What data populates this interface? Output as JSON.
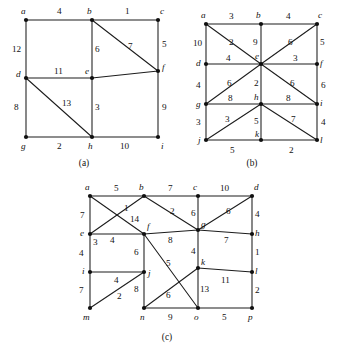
{
  "figure": {
    "background_color": "#ffffff",
    "ink_color": "#1c1c1c",
    "panels": [
      {
        "id": "a",
        "caption": "(a)",
        "caption_pos": [
          84,
          163
        ],
        "vertices": [
          {
            "name": "a",
            "x": 26,
            "y": 20,
            "label": "a",
            "label_pos": [
              21,
              14
            ]
          },
          {
            "name": "b",
            "x": 92,
            "y": 20,
            "label": "b",
            "label_pos": [
              87,
              14
            ]
          },
          {
            "name": "c",
            "x": 158,
            "y": 20,
            "label": "c",
            "label_pos": [
              160,
              14
            ]
          },
          {
            "name": "d",
            "x": 26,
            "y": 78,
            "label": "d",
            "label_pos": [
              18,
              76
            ]
          },
          {
            "name": "e",
            "x": 92,
            "y": 78,
            "label": "e",
            "label_pos": [
              85,
              74
            ]
          },
          {
            "name": "f",
            "x": 158,
            "y": 71,
            "label": "f",
            "label_pos": [
              162,
              70
            ]
          },
          {
            "name": "g",
            "x": 26,
            "y": 137,
            "label": "g",
            "label_pos": [
              21,
              148
            ]
          },
          {
            "name": "h",
            "x": 92,
            "y": 137,
            "label": "h",
            "label_pos": [
              88,
              148
            ]
          },
          {
            "name": "i",
            "x": 158,
            "y": 137,
            "label": "i",
            "label_pos": [
              161,
              148
            ]
          }
        ],
        "edges": [
          {
            "from": "a",
            "to": "b",
            "weight": "4",
            "label_pos": [
              57,
              13
            ]
          },
          {
            "from": "b",
            "to": "c",
            "weight": "1",
            "label_pos": [
              125,
              13
            ]
          },
          {
            "from": "a",
            "to": "d",
            "weight": "12",
            "label_pos": [
              15,
              52
            ]
          },
          {
            "from": "b",
            "to": "e",
            "weight": "6",
            "label_pos": [
              96,
              52
            ]
          },
          {
            "from": "c",
            "to": "f",
            "weight": "5",
            "label_pos": [
              163,
              47
            ]
          },
          {
            "from": "b",
            "to": "f",
            "weight": "7",
            "label_pos": [
              130,
              48
            ]
          },
          {
            "from": "d",
            "to": "e",
            "weight": "11",
            "label_pos": [
              55,
              73
            ]
          },
          {
            "from": "e",
            "to": "f",
            "weight": "",
            "label_pos": [
              128,
              73
            ]
          },
          {
            "from": "d",
            "to": "g",
            "weight": "8",
            "label_pos": [
              16,
              110
            ]
          },
          {
            "from": "e",
            "to": "h",
            "weight": "3",
            "label_pos": [
              96,
              110
            ]
          },
          {
            "from": "f",
            "to": "i",
            "weight": "9",
            "label_pos": [
              163,
              110
            ]
          },
          {
            "from": "d",
            "to": "h",
            "weight": "13",
            "label_pos": [
              66,
              104
            ]
          },
          {
            "from": "g",
            "to": "h",
            "weight": "2",
            "label_pos": [
              57,
              148
            ]
          },
          {
            "from": "h",
            "to": "i",
            "weight": "10",
            "label_pos": [
              122,
              148
            ]
          }
        ]
      },
      {
        "id": "b",
        "caption": "(b)",
        "caption_pos": [
          252,
          163
        ],
        "vertices": [
          {
            "name": "a",
            "x": 206,
            "y": 24,
            "label": "a",
            "label_pos": [
              201,
              17
            ]
          },
          {
            "name": "b",
            "x": 261,
            "y": 24,
            "label": "b",
            "label_pos": [
              256,
              17
            ]
          },
          {
            "name": "c",
            "x": 317,
            "y": 24,
            "label": "c",
            "label_pos": [
              318,
              17
            ]
          },
          {
            "name": "d",
            "x": 206,
            "y": 64,
            "label": "d",
            "label_pos": [
              198,
              63
            ]
          },
          {
            "name": "e",
            "x": 261,
            "y": 64,
            "label": "e",
            "label_pos": [
              256,
              58
            ]
          },
          {
            "name": "f",
            "x": 317,
            "y": 64,
            "label": "f",
            "label_pos": [
              320,
              63
            ]
          },
          {
            "name": "g",
            "x": 206,
            "y": 104,
            "label": "g",
            "label_pos": [
              198,
              105
            ]
          },
          {
            "name": "h",
            "x": 261,
            "y": 104,
            "label": "h",
            "label_pos": [
              255,
              98
            ]
          },
          {
            "name": "i",
            "x": 317,
            "y": 104,
            "label": "i",
            "label_pos": [
              320,
              104
            ]
          },
          {
            "name": "j",
            "x": 206,
            "y": 140,
            "label": "j",
            "label_pos": [
              199,
              140
            ]
          },
          {
            "name": "k",
            "x": 261,
            "y": 140,
            "label": "k",
            "label_pos": [
              256,
              134
            ]
          },
          {
            "name": "l",
            "x": 317,
            "y": 140,
            "label": "l",
            "label_pos": [
              320,
              140
            ]
          }
        ],
        "edges": [
          {
            "from": "a",
            "to": "b",
            "weight": "3",
            "label_pos": [
              230,
              18
            ]
          },
          {
            "from": "b",
            "to": "c",
            "weight": "4",
            "label_pos": [
              287,
              18
            ]
          },
          {
            "from": "a",
            "to": "d",
            "weight": "10",
            "label_pos": [
              195,
              45
            ]
          },
          {
            "from": "b",
            "to": "e",
            "weight": "9",
            "label_pos": [
              254,
              44
            ]
          },
          {
            "from": "c",
            "to": "f",
            "weight": "5",
            "label_pos": [
              321,
              44
            ]
          },
          {
            "from": "a",
            "to": "e",
            "weight": "2",
            "label_pos": [
              232,
              44
            ]
          },
          {
            "from": "c",
            "to": "e",
            "weight": "6",
            "label_pos": [
              289,
              44
            ]
          },
          {
            "from": "d",
            "to": "e",
            "weight": "4",
            "label_pos": [
              228,
              60
            ]
          },
          {
            "from": "e",
            "to": "f",
            "weight": "3",
            "label_pos": [
              293,
              60
            ]
          },
          {
            "from": "d",
            "to": "g",
            "weight": "4",
            "label_pos": [
              197,
              87
            ]
          },
          {
            "from": "e",
            "to": "h",
            "weight": "2",
            "label_pos": [
              255,
              84
            ]
          },
          {
            "from": "f",
            "to": "i",
            "weight": "6",
            "label_pos": [
              322,
              86
            ]
          },
          {
            "from": "g",
            "to": "e",
            "weight": "6",
            "label_pos": [
              229,
              84
            ]
          },
          {
            "from": "e",
            "to": "i",
            "weight": "6",
            "label_pos": [
              291,
              84
            ]
          },
          {
            "from": "g",
            "to": "h",
            "weight": "8",
            "label_pos": [
              229,
              99
            ]
          },
          {
            "from": "h",
            "to": "i",
            "weight": "8",
            "label_pos": [
              287,
              99
            ]
          },
          {
            "from": "g",
            "to": "j",
            "weight": "3",
            "label_pos": [
              197,
              124
            ]
          },
          {
            "from": "h",
            "to": "k",
            "weight": "5",
            "label_pos": [
              255,
              122
            ]
          },
          {
            "from": "i",
            "to": "l",
            "weight": "4",
            "label_pos": [
              322,
              124
            ]
          },
          {
            "from": "j",
            "to": "h",
            "weight": "3",
            "label_pos": [
              227,
              121
            ]
          },
          {
            "from": "h",
            "to": "l",
            "weight": "7",
            "label_pos": [
              292,
              121
            ]
          },
          {
            "from": "j",
            "to": "k",
            "weight": "5",
            "label_pos": [
              231,
              152
            ]
          },
          {
            "from": "k",
            "to": "l",
            "weight": "2",
            "label_pos": [
              290,
              152
            ]
          }
        ]
      },
      {
        "id": "c",
        "caption": "(c)",
        "caption_pos": [
          167,
          338
        ]
      }
    ],
    "panel_c": {
      "vertices": [
        {
          "name": "a",
          "x": 90,
          "y": 196,
          "label": "a",
          "label_pos": [
            85,
            190
          ]
        },
        {
          "name": "b",
          "x": 144,
          "y": 196,
          "label": "b",
          "label_pos": [
            139,
            190
          ]
        },
        {
          "name": "c",
          "x": 198,
          "y": 196,
          "label": "c",
          "label_pos": [
            193,
            190
          ]
        },
        {
          "name": "d",
          "x": 252,
          "y": 196,
          "label": "d",
          "label_pos": [
            254,
            190
          ]
        },
        {
          "name": "e",
          "x": 90,
          "y": 234,
          "label": "e",
          "label_pos": [
            82,
            234
          ]
        },
        {
          "name": "f",
          "x": 144,
          "y": 234,
          "label": "f",
          "label_pos": [
            147,
            228
          ]
        },
        {
          "name": "g",
          "x": 198,
          "y": 230,
          "label": "g",
          "label_pos": [
            201,
            226
          ]
        },
        {
          "name": "h",
          "x": 252,
          "y": 234,
          "label": "h",
          "label_pos": [
            255,
            234
          ]
        },
        {
          "name": "i",
          "x": 90,
          "y": 272,
          "label": "i",
          "label_pos": [
            83,
            272
          ]
        },
        {
          "name": "j",
          "x": 144,
          "y": 272,
          "label": "j",
          "label_pos": [
            147,
            274
          ]
        },
        {
          "name": "k",
          "x": 198,
          "y": 268,
          "label": "k",
          "label_pos": [
            201,
            263
          ]
        },
        {
          "name": "l",
          "x": 252,
          "y": 272,
          "label": "l",
          "label_pos": [
            255,
            272
          ]
        },
        {
          "name": "m",
          "x": 90,
          "y": 308,
          "label": "m",
          "label_pos": [
            84,
            319
          ]
        },
        {
          "name": "n",
          "x": 144,
          "y": 308,
          "label": "n",
          "label_pos": [
            140,
            319
          ]
        },
        {
          "name": "o",
          "x": 198,
          "y": 308,
          "label": "o",
          "label_pos": [
            194,
            319
          ]
        },
        {
          "name": "p",
          "x": 252,
          "y": 308,
          "label": "p",
          "label_pos": [
            249,
            319
          ]
        }
      ],
      "edges": [
        {
          "from": "a",
          "to": "b",
          "weight": "5",
          "label_pos": [
            116,
            190
          ]
        },
        {
          "from": "b",
          "to": "c",
          "weight": "7",
          "label_pos": [
            170,
            190
          ]
        },
        {
          "from": "c",
          "to": "d",
          "weight": "10",
          "label_pos": [
            223,
            190
          ]
        },
        {
          "from": "a",
          "to": "e",
          "weight": "7",
          "label_pos": [
            80,
            216
          ]
        },
        {
          "from": "c",
          "to": "g",
          "weight": "6",
          "label_pos": [
            193,
            214
          ]
        },
        {
          "from": "d",
          "to": "h",
          "weight": "4",
          "label_pos": [
            256,
            215
          ]
        },
        {
          "from": "b",
          "to": "e",
          "weight": "1",
          "label_pos": [
            126,
            209
          ]
        },
        {
          "from": "a",
          "to": "f",
          "weight": "14",
          "label_pos": [
            134,
            220
          ]
        },
        {
          "from": "b",
          "to": "g",
          "weight": "2",
          "label_pos": [
            172,
            212
          ]
        },
        {
          "from": "d",
          "to": "g",
          "weight": "6",
          "label_pos": [
            228,
            212
          ]
        },
        {
          "from": "e",
          "to": "f",
          "weight": "4",
          "label_pos": [
            112,
            241
          ]
        },
        {
          "from": "f",
          "to": "g",
          "weight": "8",
          "label_pos": [
            170,
            241
          ]
        },
        {
          "from": "g",
          "to": "h",
          "weight": "7",
          "label_pos": [
            226,
            241
          ]
        },
        {
          "from": "e",
          "to": "i",
          "weight": "4",
          "label_pos": [
            80,
            254
          ]
        },
        {
          "from": "e",
          "to": "i2",
          "weight": "3",
          "label_pos": [
            95,
            243
          ]
        },
        {
          "from": "f",
          "to": "j",
          "weight": "6",
          "label_pos": [
            136,
            253
          ]
        },
        {
          "from": "g",
          "to": "k",
          "weight": "4",
          "label_pos": [
            193,
            252
          ]
        },
        {
          "from": "h",
          "to": "l",
          "weight": "1",
          "label_pos": [
            256,
            253
          ]
        },
        {
          "from": "f",
          "to": "o",
          "weight": "5",
          "label_pos": [
            168,
            264
          ]
        },
        {
          "from": "i",
          "to": "j",
          "weight": "4",
          "label_pos": [
            116,
            281
          ]
        },
        {
          "from": "k",
          "to": "l",
          "weight": "11",
          "label_pos": [
            224,
            281
          ]
        },
        {
          "from": "i",
          "to": "m",
          "weight": "7",
          "label_pos": [
            80,
            291
          ]
        },
        {
          "from": "j",
          "to": "n",
          "weight": "8",
          "label_pos": [
            136,
            290
          ]
        },
        {
          "from": "k",
          "to": "o",
          "weight": "13",
          "label_pos": [
            202,
            290
          ]
        },
        {
          "from": "l",
          "to": "p",
          "weight": "2",
          "label_pos": [
            256,
            291
          ]
        },
        {
          "from": "m",
          "to": "j",
          "weight": "2",
          "label_pos": [
            119,
            297
          ]
        },
        {
          "from": "n",
          "to": "k",
          "weight": "6",
          "label_pos": [
            168,
            296
          ]
        },
        {
          "from": "n",
          "to": "o",
          "weight": "9",
          "label_pos": [
            170,
            319
          ]
        },
        {
          "from": "o",
          "to": "p",
          "weight": "5",
          "label_pos": [
            224,
            319
          ]
        }
      ]
    }
  }
}
